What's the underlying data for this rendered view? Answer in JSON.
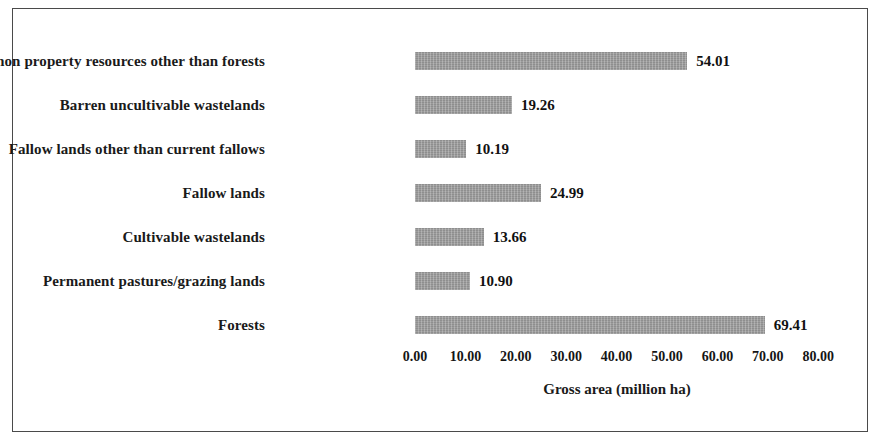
{
  "chart_data": {
    "type": "bar",
    "orientation": "horizontal",
    "title": "",
    "xlabel": "Gross area (million ha)",
    "ylabel": "",
    "xlim": [
      0,
      80
    ],
    "xticks": [
      "0.00",
      "10.00",
      "20.00",
      "30.00",
      "40.00",
      "50.00",
      "60.00",
      "70.00",
      "80.00"
    ],
    "xtick_values": [
      0,
      10,
      20,
      30,
      40,
      50,
      60,
      70,
      80
    ],
    "grid": false,
    "legend": false,
    "bar_color": "#9c9c9c",
    "categories": [
      "Total common property resources other than forests",
      "Barren uncultivable wastelands",
      "Fallow lands other than current fallows",
      "Fallow lands",
      "Cultivable wastelands",
      "Permanent pastures/grazing lands",
      "Forests"
    ],
    "values": [
      54.01,
      19.26,
      10.19,
      24.99,
      13.66,
      10.9,
      69.41
    ],
    "value_labels": [
      "54.01",
      "19.26",
      "10.19",
      "24.99",
      "13.66",
      "10.90",
      "69.41"
    ]
  }
}
